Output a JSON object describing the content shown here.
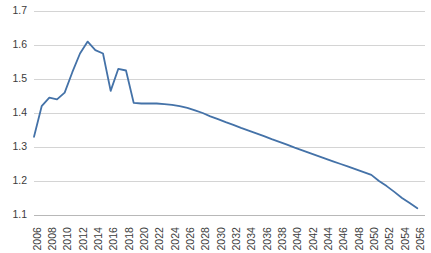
{
  "chart_data": {
    "type": "line",
    "title": "",
    "subtitle": "",
    "xlabel": "",
    "ylabel": "",
    "grid": true,
    "legend": false,
    "legend_position": "none",
    "line_color": "#4472a8",
    "grid_color": "#d4d4d4",
    "axis_color": "#b8b8b8",
    "tick_label_color": "#3b3b3b",
    "xlim": [
      2006,
      2057
    ],
    "ylim": [
      1.1,
      1.7
    ],
    "ytick_labels": [
      "1.7",
      "1.6",
      "1.5",
      "1.4",
      "1.3",
      "1.2",
      "1.1"
    ],
    "ytick_values": [
      1.7,
      1.6,
      1.5,
      1.4,
      1.3,
      1.2,
      1.1
    ],
    "xtick_labels": [
      "2006",
      "2008",
      "2010",
      "2012",
      "2014",
      "2016",
      "2018",
      "2020",
      "2022",
      "2024",
      "2026",
      "2028",
      "2030",
      "2032",
      "2034",
      "2036",
      "2038",
      "2040",
      "2042",
      "2044",
      "2046",
      "2048",
      "2050",
      "2052",
      "2054",
      "2056"
    ],
    "xtick_values": [
      2006,
      2008,
      2010,
      2012,
      2014,
      2016,
      2018,
      2020,
      2022,
      2024,
      2026,
      2028,
      2030,
      2032,
      2034,
      2036,
      2038,
      2040,
      2042,
      2044,
      2046,
      2048,
      2050,
      2052,
      2054,
      2056
    ],
    "x": [
      2006,
      2007,
      2008,
      2009,
      2010,
      2011,
      2012,
      2013,
      2014,
      2015,
      2016,
      2017,
      2018,
      2019,
      2020,
      2021,
      2022,
      2023,
      2024,
      2025,
      2026,
      2027,
      2028,
      2029,
      2030,
      2031,
      2032,
      2033,
      2034,
      2035,
      2036,
      2037,
      2038,
      2039,
      2040,
      2041,
      2042,
      2043,
      2044,
      2045,
      2046,
      2047,
      2048,
      2049,
      2050,
      2051,
      2052,
      2053,
      2054,
      2055,
      2056
    ],
    "values": [
      1.33,
      1.42,
      1.445,
      1.44,
      1.46,
      1.52,
      1.575,
      1.61,
      1.585,
      1.575,
      1.465,
      1.53,
      1.525,
      1.43,
      1.428,
      1.428,
      1.428,
      1.426,
      1.424,
      1.42,
      1.415,
      1.408,
      1.4,
      1.39,
      1.382,
      1.373,
      1.365,
      1.356,
      1.348,
      1.34,
      1.332,
      1.323,
      1.315,
      1.307,
      1.298,
      1.29,
      1.282,
      1.274,
      1.266,
      1.258,
      1.25,
      1.242,
      1.234,
      1.226,
      1.218,
      1.2,
      1.185,
      1.168,
      1.15,
      1.135,
      1.12
    ]
  }
}
